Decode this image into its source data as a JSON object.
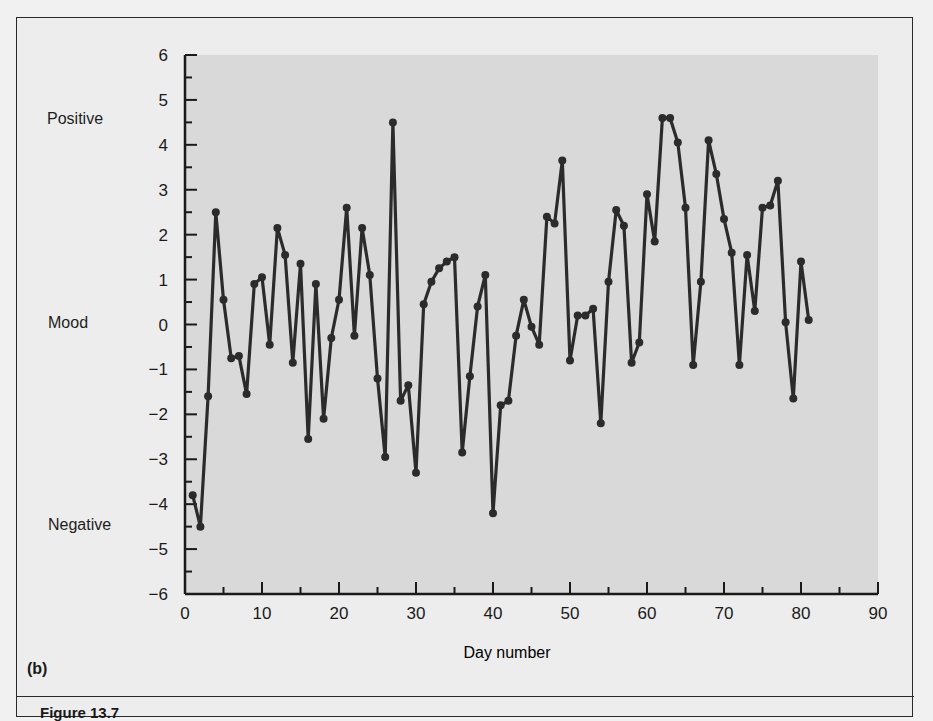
{
  "figure": {
    "panel_label": "(b)",
    "caption_partial": "Figure 13.7",
    "side_labels": {
      "top": "Positive",
      "middle": "Mood",
      "bottom": "Negative"
    },
    "colors": {
      "background": "#ededed",
      "plot_area": "#d9d9d9",
      "line": "#2b2b2b",
      "axis": "#1a1a1a"
    }
  },
  "chart_data": {
    "type": "line",
    "title": "",
    "xlabel": "Day number",
    "ylabel": "Mood",
    "xlim": [
      0,
      90
    ],
    "ylim": [
      -6,
      6
    ],
    "x_ticks": [
      0,
      10,
      20,
      30,
      40,
      50,
      60,
      70,
      80,
      90
    ],
    "y_ticks": [
      6,
      5,
      4,
      3,
      2,
      1,
      0,
      -1,
      -2,
      -3,
      -4,
      -5,
      -6
    ],
    "grid": false,
    "legend": null,
    "annotations": [
      "Positive",
      "Mood",
      "Negative",
      "(b)"
    ],
    "series": [
      {
        "name": "Daily mood",
        "markers": true,
        "x": [
          1,
          2,
          3,
          4,
          5,
          6,
          7,
          8,
          9,
          10,
          11,
          12,
          13,
          14,
          15,
          16,
          17,
          18,
          19,
          20,
          21,
          22,
          23,
          24,
          25,
          26,
          27,
          28,
          29,
          30,
          31,
          32,
          33,
          34,
          35,
          36,
          37,
          38,
          39,
          40,
          41,
          42,
          43,
          44,
          45,
          46,
          47,
          48,
          49,
          50,
          51,
          52,
          53,
          54,
          55,
          56,
          57,
          58,
          59,
          60,
          61,
          62,
          63,
          64,
          65,
          66,
          67,
          68,
          69,
          70,
          71,
          72,
          73,
          74,
          75,
          76,
          77,
          78,
          79,
          80,
          81
        ],
        "values": [
          -3.8,
          -4.5,
          -1.6,
          2.5,
          0.55,
          -0.75,
          -0.7,
          -1.55,
          0.9,
          1.05,
          -0.45,
          2.15,
          1.55,
          -0.85,
          1.35,
          -2.55,
          0.9,
          -2.1,
          -0.3,
          0.55,
          2.6,
          -0.25,
          2.15,
          1.1,
          -1.2,
          -2.95,
          4.5,
          -1.7,
          -1.35,
          -3.3,
          0.45,
          0.95,
          1.25,
          1.4,
          1.5,
          -2.85,
          -1.15,
          0.4,
          1.1,
          -4.2,
          -1.8,
          -1.7,
          -0.25,
          0.55,
          -0.05,
          -0.45,
          2.4,
          2.25,
          3.65,
          -0.8,
          0.2,
          0.2,
          0.35,
          -2.2,
          0.95,
          2.55,
          2.2,
          -0.85,
          -0.4,
          2.9,
          1.85,
          4.6,
          4.6,
          4.05,
          2.6,
          -0.9,
          0.95,
          4.1,
          3.35,
          2.35,
          1.6,
          -0.9,
          1.55,
          0.3,
          2.6,
          2.65,
          3.2,
          0.05,
          -1.65,
          1.4,
          0.1
        ]
      }
    ]
  }
}
